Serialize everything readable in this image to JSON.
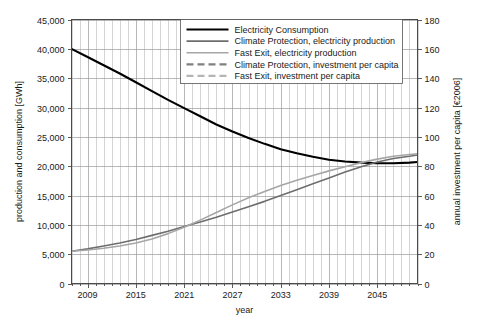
{
  "chart_data": {
    "type": "line",
    "title": "",
    "xlabel": "year",
    "ylabel": "production and consumption [GWh]",
    "y2label": "annual investment per capita [€2006]",
    "xlim": [
      2007,
      2050
    ],
    "ylim": [
      0,
      45000
    ],
    "y2lim": [
      0,
      180
    ],
    "grid": true,
    "legend_position": "top-right",
    "x_tick_labels": [
      "2009",
      "2015",
      "2021",
      "2027",
      "2033",
      "2039",
      "2045"
    ],
    "x_tick_values": [
      2009,
      2015,
      2021,
      2027,
      2033,
      2039,
      2045
    ],
    "x_minor_step": 1,
    "y_tick_labels": [
      "0",
      "5,000",
      "10,000",
      "15,000",
      "20,000",
      "25,000",
      "30,000",
      "35,000",
      "40,000",
      "45,000"
    ],
    "y_tick_values": [
      0,
      5000,
      10000,
      15000,
      20000,
      25000,
      30000,
      35000,
      40000,
      45000
    ],
    "y2_tick_labels": [
      "0",
      "20",
      "40",
      "60",
      "80",
      "100",
      "120",
      "140",
      "160",
      "180"
    ],
    "y2_tick_values": [
      0,
      20,
      40,
      60,
      80,
      100,
      120,
      140,
      160,
      180
    ],
    "x": [
      2007,
      2009,
      2011,
      2013,
      2015,
      2017,
      2019,
      2021,
      2023,
      2025,
      2027,
      2029,
      2031,
      2033,
      2035,
      2037,
      2039,
      2041,
      2043,
      2045,
      2047,
      2049,
      2050
    ],
    "series": [
      {
        "name": "Electricity Consumption",
        "axis": "left",
        "color": "#000000",
        "width": 2.1,
        "dash": "none",
        "values": [
          40000,
          38600,
          37200,
          35800,
          34300,
          32800,
          31300,
          29900,
          28500,
          27100,
          25900,
          24800,
          23800,
          22900,
          22200,
          21600,
          21100,
          20800,
          20600,
          20500,
          20500,
          20600,
          20700
        ]
      },
      {
        "name": "Climate Protection, electricity production",
        "axis": "left",
        "color": "#6e6e6e",
        "width": 1.6,
        "dash": "none",
        "values": [
          5500,
          5900,
          6400,
          6900,
          7500,
          8200,
          8900,
          9700,
          10500,
          11300,
          12200,
          13100,
          14000,
          15000,
          16000,
          17000,
          18000,
          19000,
          19900,
          20700,
          21300,
          21700,
          21900
        ]
      },
      {
        "name": "Fast Exit, electricity production",
        "axis": "left",
        "color": "#a6a6a6",
        "width": 1.6,
        "dash": "none",
        "values": [
          5500,
          5700,
          6000,
          6400,
          6900,
          7600,
          8500,
          9600,
          10800,
          12100,
          13400,
          14600,
          15700,
          16700,
          17600,
          18400,
          19200,
          19900,
          20600,
          21200,
          21700,
          22000,
          22100
        ]
      },
      {
        "name": "Climate Protection, investment per capita",
        "axis": "right",
        "color": "#808080",
        "width": 2.2,
        "dash": "7,4",
        "values": [
          2500,
          5000,
          8000,
          11200,
          14000,
          15200,
          15500,
          15600,
          15600,
          15500,
          15300,
          15000,
          14600,
          14200,
          14000,
          14100,
          14600,
          15400,
          16400,
          17600,
          19000,
          20400,
          21000
        ]
      },
      {
        "name": "Fast Exit, investment per capita",
        "axis": "right",
        "color": "#b5b5b5",
        "width": 2.2,
        "dash": "7,4",
        "values": [
          5500,
          7500,
          11000,
          15500,
          19500,
          22000,
          23600,
          24500,
          25000,
          25400,
          25500,
          25300,
          24900,
          24500,
          24300,
          24300,
          24500,
          24900,
          25400,
          25900,
          26400,
          26900,
          27100
        ]
      }
    ],
    "legend": [
      {
        "label": "Electricity Consumption",
        "color": "#000000",
        "dash": "none",
        "width": 2.1
      },
      {
        "label": "Climate Protection, electricity production",
        "color": "#6e6e6e",
        "dash": "none",
        "width": 1.6
      },
      {
        "label": "Fast Exit, electricity production",
        "color": "#a6a6a6",
        "dash": "none",
        "width": 1.6
      },
      {
        "label": "Climate Protection, investment per capita",
        "color": "#808080",
        "dash": "7,4",
        "width": 2.2
      },
      {
        "label": "Fast Exit, investment per capita",
        "color": "#b5b5b5",
        "dash": "7,4",
        "width": 2.2
      }
    ]
  }
}
